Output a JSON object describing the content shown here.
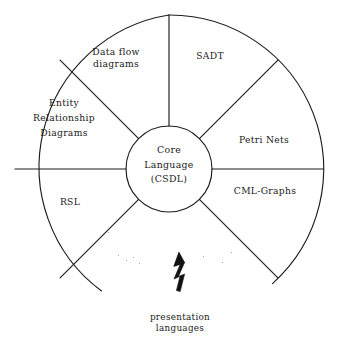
{
  "diagram": {
    "type": "wheel-hub-and-spoke",
    "hub": {
      "lines": [
        "Core",
        "Language",
        "(CSDL)"
      ],
      "text": "Core\nLanguage\n(CSDL)"
    },
    "segments": [
      {
        "id": "sadt",
        "text": "SADT",
        "position": "upper-right"
      },
      {
        "id": "petri-nets",
        "text": "Petri Nets",
        "position": "right-upper"
      },
      {
        "id": "cml-graphs",
        "text": "CML-Graphs",
        "position": "right-lower"
      },
      {
        "id": "rsl",
        "text": "RSL",
        "position": "lower-left"
      },
      {
        "id": "erd",
        "text": "Entity\nRelationship\nDiagrams",
        "position": "left"
      },
      {
        "id": "dfd",
        "text": "Data flow\ndiagrams",
        "position": "upper-left"
      }
    ],
    "caption": {
      "text": "presentation\nlanguages",
      "arrow_icon": "lightning-bolt-arrow-up"
    },
    "colors": {
      "stroke": "#1c1c1c",
      "text": "#1a1a1a",
      "background": "#ffffff"
    }
  }
}
